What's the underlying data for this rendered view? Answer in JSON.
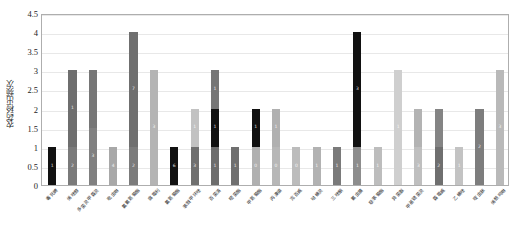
{
  "chart_data": {
    "type": "bar",
    "stacked": true,
    "title": "",
    "xlabel": "",
    "ylabel": "农药检出频次",
    "ylim": [
      0,
      4.5
    ],
    "yticks": [
      "0",
      "0.5",
      "1",
      "1.5",
      "2",
      "2.5",
      "3",
      "3.5",
      "4",
      "4.5"
    ],
    "grid": true,
    "legend": "none",
    "categories": [
      "毒死蜱",
      "烯唑醇",
      "多菌灵甲霜灵",
      "吡虫啉",
      "氯氟氰菊酯",
      "腐霉利",
      "氯氰菊酯",
      "苯醚甲环唑",
      "百菌清",
      "嘧菌酯",
      "甲氰菊酯",
      "丙溴磷",
      "克百威",
      "哒螨灵",
      "三唑酮",
      "氟虫腈",
      "联苯菊酯",
      "异菌脲",
      "甲基硫菌灵",
      "霜霉威",
      "乙螨唑",
      "啶虫脒",
      "烯酰吗啉"
    ],
    "values": [
      1,
      3,
      3,
      1,
      4,
      3,
      1,
      2,
      3,
      1,
      2,
      2,
      1,
      1,
      1,
      4,
      1,
      3,
      2,
      2,
      1,
      2,
      3
    ],
    "bars": [
      {
        "total": 1,
        "segments": [
          {
            "v": 1,
            "color": "#111111",
            "label": "1",
            "text": "#ffffff"
          }
        ]
      },
      {
        "total": 3,
        "segments": [
          {
            "v": 1,
            "color": "#7a7a7a",
            "label": "2",
            "text": "#ffffff"
          },
          {
            "v": 2,
            "color": "#6e6e6e",
            "label": "1",
            "text": "#ffffff"
          }
        ]
      },
      {
        "total": 3,
        "segments": [
          {
            "v": 1.5,
            "color": "#808080",
            "label": "3",
            "text": "#ffffff"
          },
          {
            "v": 1.5,
            "color": "#767676",
            "label": "",
            "text": "#ffffff"
          }
        ]
      },
      {
        "total": 1,
        "segments": [
          {
            "v": 1,
            "color": "#a8a8a8",
            "label": "4",
            "text": "#ffffff"
          }
        ]
      },
      {
        "total": 4,
        "segments": [
          {
            "v": 1,
            "color": "#7b7b7b",
            "label": "2",
            "text": "#ffffff"
          },
          {
            "v": 3,
            "color": "#6f6f6f",
            "label": "7",
            "text": "#ffffff"
          }
        ]
      },
      {
        "total": 3,
        "segments": [
          {
            "v": 3,
            "color": "#b4b4b4",
            "label": "3",
            "text": "#ffffff"
          }
        ]
      },
      {
        "total": 1,
        "segments": [
          {
            "v": 1,
            "color": "#111111",
            "label": "6",
            "text": "#ffffff"
          }
        ]
      },
      {
        "total": 2,
        "segments": [
          {
            "v": 1,
            "color": "#6f6f6f",
            "label": "3",
            "text": "#ffffff"
          },
          {
            "v": 1,
            "color": "#c2c2c2",
            "label": "1",
            "text": "#ffffff"
          }
        ]
      },
      {
        "total": 3,
        "segments": [
          {
            "v": 1,
            "color": "#6d6d6d",
            "label": "1",
            "text": "#ffffff"
          },
          {
            "v": 1,
            "color": "#111111",
            "label": "1",
            "text": "#ffffff"
          },
          {
            "v": 1,
            "color": "#767676",
            "label": "1",
            "text": "#ffffff"
          }
        ]
      },
      {
        "total": 1,
        "segments": [
          {
            "v": 1,
            "color": "#6f6f6f",
            "label": "1",
            "text": "#ffffff"
          }
        ]
      },
      {
        "total": 2,
        "segments": [
          {
            "v": 1,
            "color": "#b0b0b0",
            "label": "0",
            "text": "#ffffff"
          },
          {
            "v": 1,
            "color": "#111111",
            "label": "1",
            "text": "#ffffff"
          }
        ]
      },
      {
        "total": 2,
        "segments": [
          {
            "v": 1,
            "color": "#b7b7b7",
            "label": "0",
            "text": "#ffffff"
          },
          {
            "v": 1,
            "color": "#b0b0b0",
            "label": "1",
            "text": "#ffffff"
          }
        ]
      },
      {
        "total": 1,
        "segments": [
          {
            "v": 1,
            "color": "#bcbcbc",
            "label": "0",
            "text": "#ffffff"
          }
        ]
      },
      {
        "total": 1,
        "segments": [
          {
            "v": 1,
            "color": "#b2b2b2",
            "label": "1",
            "text": "#ffffff"
          }
        ]
      },
      {
        "total": 1,
        "segments": [
          {
            "v": 1,
            "color": "#7a7a7a",
            "label": "1",
            "text": "#ffffff"
          }
        ]
      },
      {
        "total": 4,
        "segments": [
          {
            "v": 1,
            "color": "#8d8d8d",
            "label": "1",
            "text": "#ffffff"
          },
          {
            "v": 3,
            "color": "#111111",
            "label": "3",
            "text": "#ffffff"
          }
        ]
      },
      {
        "total": 1,
        "segments": [
          {
            "v": 1,
            "color": "#bdbdbd",
            "label": "1",
            "text": "#ffffff"
          }
        ]
      },
      {
        "total": 3,
        "segments": [
          {
            "v": 3,
            "color": "#cfcfcf",
            "label": "1",
            "text": "#ffffff"
          }
        ]
      },
      {
        "total": 2,
        "segments": [
          {
            "v": 1,
            "color": "#bfbfbf",
            "label": "3",
            "text": "#ffffff"
          },
          {
            "v": 1,
            "color": "#b3b3b3",
            "label": "",
            "text": "#ffffff"
          }
        ]
      },
      {
        "total": 2,
        "segments": [
          {
            "v": 1,
            "color": "#6f6f6f",
            "label": "2",
            "text": "#ffffff"
          },
          {
            "v": 1,
            "color": "#848484",
            "label": "",
            "text": "#ffffff"
          }
        ]
      },
      {
        "total": 1,
        "segments": [
          {
            "v": 1,
            "color": "#c3c3c3",
            "label": "1",
            "text": "#ffffff"
          }
        ]
      },
      {
        "total": 2,
        "segments": [
          {
            "v": 2,
            "color": "#7d7d7d",
            "label": "2",
            "text": "#ffffff"
          }
        ]
      },
      {
        "total": 3,
        "segments": [
          {
            "v": 3,
            "color": "#b9b9b9",
            "label": "3",
            "text": "#ffffff"
          }
        ]
      }
    ]
  },
  "style": {
    "axis_color": "#aeaeae",
    "grid_color": "#e8e8e8",
    "background": "#ffffff",
    "tick_text_color": "#1d1d1d"
  }
}
